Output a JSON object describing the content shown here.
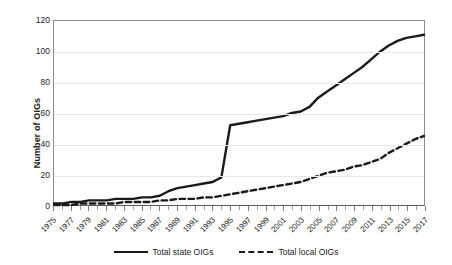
{
  "chart_data": {
    "type": "line",
    "title": "",
    "xlabel": "",
    "ylabel": "Number of OIGs",
    "ylim": [
      0,
      120
    ],
    "xlim": [
      1975,
      2017
    ],
    "yticks": [
      0,
      20,
      40,
      60,
      80,
      100,
      120
    ],
    "grid": "horizontal",
    "legend_position": "bottom-center",
    "x": [
      1975,
      1976,
      1977,
      1978,
      1979,
      1980,
      1981,
      1982,
      1983,
      1984,
      1985,
      1986,
      1987,
      1988,
      1989,
      1990,
      1991,
      1992,
      1993,
      1994,
      1995,
      1996,
      1997,
      1998,
      1999,
      2000,
      2001,
      2002,
      2003,
      2004,
      2005,
      2006,
      2007,
      2008,
      2009,
      2010,
      2011,
      2012,
      2013,
      2014,
      2015,
      2016,
      2017
    ],
    "xtick_labels": [
      "1975",
      "1977",
      "1979",
      "1981",
      "1983",
      "1985",
      "1987",
      "1989",
      "1991",
      "1993",
      "1995",
      "1997",
      "1999",
      "2001",
      "2003",
      "2005",
      "2007",
      "2009",
      "2011",
      "2013",
      "2015",
      "2017"
    ],
    "series": [
      {
        "name": "Total state OIGs",
        "style": "solid",
        "color": "#1a1a1a",
        "values": [
          1,
          1,
          2,
          2,
          3,
          3,
          3,
          4,
          4,
          4,
          5,
          5,
          6,
          9,
          11,
          12,
          13,
          14,
          15,
          18,
          52,
          53,
          54,
          55,
          56,
          57,
          58,
          60,
          61,
          64,
          70,
          74,
          78,
          82,
          86,
          90,
          95,
          100,
          104,
          107,
          109,
          110,
          111
        ]
      },
      {
        "name": "Total local OIGs",
        "style": "dashed",
        "color": "#1a1a1a",
        "values": [
          0,
          0,
          0,
          1,
          1,
          1,
          1,
          1,
          2,
          2,
          2,
          2,
          3,
          3,
          4,
          4,
          4,
          5,
          5,
          6,
          7,
          8,
          9,
          10,
          11,
          12,
          13,
          14,
          15,
          17,
          19,
          21,
          22,
          23,
          25,
          26,
          28,
          30,
          34,
          37,
          40,
          43,
          45
        ]
      }
    ]
  },
  "legend": {
    "items": [
      {
        "label": "Total state OIGs",
        "style": "solid"
      },
      {
        "label": "Total local OIGs",
        "style": "dashed"
      }
    ]
  }
}
